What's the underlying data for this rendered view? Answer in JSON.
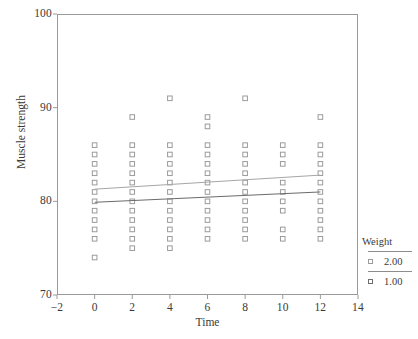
{
  "chart_data": {
    "type": "scatter",
    "title": "",
    "xlabel": "Time",
    "ylabel": "Muscle strength",
    "xlim": [
      -2,
      14
    ],
    "ylim": [
      70,
      100
    ],
    "xticks": [
      -2,
      0,
      2,
      4,
      6,
      8,
      10,
      12,
      14
    ],
    "xtick_labels": [
      "−2",
      "0",
      "2",
      "4",
      "6",
      "8",
      "10",
      "12",
      "14"
    ],
    "yticks": [
      70,
      80,
      90,
      100
    ],
    "ytick_labels": [
      "70",
      "80",
      "90",
      "100"
    ],
    "grid": false,
    "marker": "open-square",
    "legend": {
      "title": "Weight",
      "position": "right",
      "entries": [
        {
          "label": "2.00",
          "marker": "open-square",
          "color": "#9b9b9b"
        },
        {
          "label": "1.00",
          "marker": "open-square",
          "color": "#6d6d6d"
        }
      ]
    },
    "series": [
      {
        "name": "2.00",
        "color": "#9b9b9b",
        "points": [
          {
            "x": 0,
            "y": 74.0
          },
          {
            "x": 0,
            "y": 76.0
          },
          {
            "x": 0,
            "y": 77.0
          },
          {
            "x": 0,
            "y": 78.0
          },
          {
            "x": 0,
            "y": 79.0
          },
          {
            "x": 0,
            "y": 80.0
          },
          {
            "x": 0,
            "y": 81.0
          },
          {
            "x": 0,
            "y": 82.0
          },
          {
            "x": 0,
            "y": 83.0
          },
          {
            "x": 0,
            "y": 84.0
          },
          {
            "x": 0,
            "y": 85.0
          },
          {
            "x": 0,
            "y": 86.0
          },
          {
            "x": 2,
            "y": 75.0
          },
          {
            "x": 2,
            "y": 76.0
          },
          {
            "x": 2,
            "y": 77.0
          },
          {
            "x": 2,
            "y": 78.0
          },
          {
            "x": 2,
            "y": 79.0
          },
          {
            "x": 2,
            "y": 80.0
          },
          {
            "x": 2,
            "y": 81.0
          },
          {
            "x": 2,
            "y": 82.0
          },
          {
            "x": 2,
            "y": 83.0
          },
          {
            "x": 2,
            "y": 84.0
          },
          {
            "x": 2,
            "y": 85.0
          },
          {
            "x": 2,
            "y": 86.0
          },
          {
            "x": 2,
            "y": 89.0
          },
          {
            "x": 4,
            "y": 75.0
          },
          {
            "x": 4,
            "y": 76.0
          },
          {
            "x": 4,
            "y": 77.0
          },
          {
            "x": 4,
            "y": 78.0
          },
          {
            "x": 4,
            "y": 79.0
          },
          {
            "x": 4,
            "y": 80.0
          },
          {
            "x": 4,
            "y": 81.0
          },
          {
            "x": 4,
            "y": 82.0
          },
          {
            "x": 4,
            "y": 83.0
          },
          {
            "x": 4,
            "y": 84.0
          },
          {
            "x": 4,
            "y": 85.0
          },
          {
            "x": 4,
            "y": 86.0
          },
          {
            "x": 4,
            "y": 91.0
          },
          {
            "x": 6,
            "y": 76.0
          },
          {
            "x": 6,
            "y": 77.0
          },
          {
            "x": 6,
            "y": 78.0
          },
          {
            "x": 6,
            "y": 79.0
          },
          {
            "x": 6,
            "y": 80.0
          },
          {
            "x": 6,
            "y": 81.0
          },
          {
            "x": 6,
            "y": 82.0
          },
          {
            "x": 6,
            "y": 83.0
          },
          {
            "x": 6,
            "y": 84.0
          },
          {
            "x": 6,
            "y": 85.0
          },
          {
            "x": 6,
            "y": 86.0
          },
          {
            "x": 6,
            "y": 88.0
          },
          {
            "x": 6,
            "y": 89.0
          },
          {
            "x": 8,
            "y": 76.0
          },
          {
            "x": 8,
            "y": 77.0
          },
          {
            "x": 8,
            "y": 78.0
          },
          {
            "x": 8,
            "y": 79.0
          },
          {
            "x": 8,
            "y": 80.0
          },
          {
            "x": 8,
            "y": 81.0
          },
          {
            "x": 8,
            "y": 82.0
          },
          {
            "x": 8,
            "y": 83.0
          },
          {
            "x": 8,
            "y": 84.0
          },
          {
            "x": 8,
            "y": 85.0
          },
          {
            "x": 8,
            "y": 86.0
          },
          {
            "x": 8,
            "y": 91.0
          },
          {
            "x": 10,
            "y": 76.0
          },
          {
            "x": 10,
            "y": 77.0
          },
          {
            "x": 10,
            "y": 79.0
          },
          {
            "x": 10,
            "y": 80.0
          },
          {
            "x": 10,
            "y": 81.0
          },
          {
            "x": 10,
            "y": 82.0
          },
          {
            "x": 10,
            "y": 84.0
          },
          {
            "x": 10,
            "y": 85.0
          },
          {
            "x": 10,
            "y": 86.0
          },
          {
            "x": 12,
            "y": 76.0
          },
          {
            "x": 12,
            "y": 77.0
          },
          {
            "x": 12,
            "y": 78.0
          },
          {
            "x": 12,
            "y": 79.0
          },
          {
            "x": 12,
            "y": 80.0
          },
          {
            "x": 12,
            "y": 81.0
          },
          {
            "x": 12,
            "y": 82.0
          },
          {
            "x": 12,
            "y": 83.0
          },
          {
            "x": 12,
            "y": 84.0
          },
          {
            "x": 12,
            "y": 85.0
          },
          {
            "x": 12,
            "y": 86.0
          },
          {
            "x": 12,
            "y": 89.0
          }
        ]
      }
    ],
    "fit_lines": [
      {
        "name": "2.00",
        "color": "#a6a6a6",
        "x0": 0,
        "y0": 81.3,
        "x1": 12,
        "y1": 82.8
      },
      {
        "name": "1.00",
        "color": "#6b6b6b",
        "x0": 0,
        "y0": 79.9,
        "x1": 12,
        "y1": 81.0
      }
    ]
  }
}
